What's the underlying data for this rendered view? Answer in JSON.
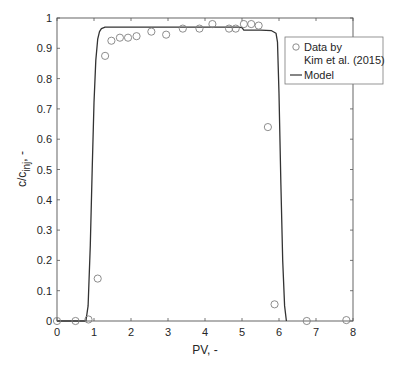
{
  "chart_data": {
    "type": "scatter+line",
    "title": "",
    "xlabel": "PV, -",
    "ylabel": "c/c_inj, -",
    "ylabel_parts": {
      "main": "c/c",
      "sub": "inj",
      "suffix": ", -"
    },
    "xlim": [
      0,
      8
    ],
    "ylim": [
      0,
      1
    ],
    "xticks": [
      0,
      1,
      2,
      3,
      4,
      5,
      6,
      7,
      8
    ],
    "yticks": [
      0,
      0.1,
      0.2,
      0.3,
      0.4,
      0.5,
      0.6,
      0.7,
      0.8,
      0.9,
      1
    ],
    "ytick_labels": [
      "0",
      "0.1",
      "0.2",
      "0.3",
      "0.4",
      "0.5",
      "0.6",
      "0.7",
      "0.8",
      "0.9",
      "1"
    ],
    "grid": false,
    "legend_position": "upper right (inside)",
    "series": [
      {
        "name": "Data by Kim et al. (2015)",
        "legend_lines": [
          "Data by",
          "Kim et al. (2015)"
        ],
        "marker": "open-circle",
        "color": "#808080",
        "x": [
          0.0,
          0.5,
          0.85,
          1.1,
          1.3,
          1.47,
          1.7,
          1.92,
          2.15,
          2.55,
          2.95,
          3.4,
          3.85,
          4.2,
          4.65,
          4.83,
          5.05,
          5.25,
          5.45,
          5.7,
          5.88,
          6.75,
          7.82
        ],
        "y": [
          0.0,
          0.0,
          0.005,
          0.14,
          0.875,
          0.925,
          0.935,
          0.935,
          0.94,
          0.955,
          0.945,
          0.965,
          0.965,
          0.98,
          0.965,
          0.965,
          0.98,
          0.98,
          0.975,
          0.64,
          0.055,
          0.0,
          0.003
        ]
      },
      {
        "name": "Model",
        "legend_lines": [
          "Model"
        ],
        "marker": "line",
        "color": "#333333",
        "x": [
          0.0,
          0.78,
          0.84,
          0.9,
          0.95,
          1.0,
          1.05,
          1.1,
          1.15,
          1.2,
          1.3,
          1.5,
          2.0,
          3.0,
          4.0,
          4.9,
          5.0,
          5.05,
          5.5,
          5.8,
          5.92,
          5.96,
          6.0,
          6.05,
          6.1,
          6.15,
          6.2
        ],
        "y": [
          0.0,
          0.0,
          0.05,
          0.25,
          0.5,
          0.72,
          0.86,
          0.93,
          0.955,
          0.965,
          0.97,
          0.97,
          0.97,
          0.97,
          0.97,
          0.97,
          0.968,
          0.96,
          0.96,
          0.958,
          0.95,
          0.92,
          0.75,
          0.45,
          0.2,
          0.05,
          0.0
        ]
      }
    ]
  }
}
